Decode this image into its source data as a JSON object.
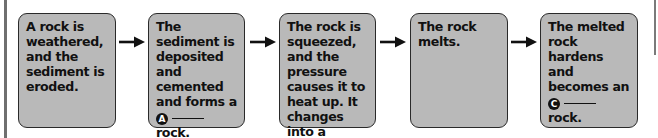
{
  "diagram": {
    "type": "flow",
    "topic": "rock cycle sequence",
    "steps": [
      {
        "pre": "A rock is weathered, and the sediment is eroded.",
        "badge": "",
        "post": ""
      },
      {
        "pre": "The sediment is deposited and cemented and forms a",
        "badge": "A",
        "post": "rock."
      },
      {
        "pre": "The rock is squeezed, and the pressure causes it to heat up. It changes into a",
        "badge": "B",
        "post": "rock."
      },
      {
        "pre": "The rock melts.",
        "badge": "",
        "post": ""
      },
      {
        "pre": "The melted rock hardens and becomes an",
        "badge": "C",
        "post": "rock."
      }
    ],
    "arrow_icon": "right-arrow-icon",
    "colors": {
      "box_fill": "#b9b9b9",
      "box_border": "#2a2a2a",
      "text": "#111111",
      "badge_fill": "#111111",
      "badge_text": "#ffffff"
    }
  }
}
